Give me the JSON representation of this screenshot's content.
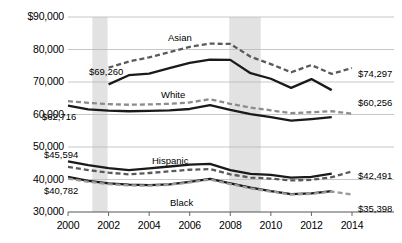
{
  "chart_data": {
    "type": "line",
    "title": "",
    "xlabel": "",
    "ylabel": "",
    "xlim": [
      2000,
      2014
    ],
    "ylim": [
      30000,
      90000
    ],
    "grid": true,
    "legend": "inline-labels",
    "y_ticks": [
      "$90,000",
      "80,000",
      "70,000",
      "60,000",
      "50,000",
      "40,000",
      "30,000"
    ],
    "y_tick_values": [
      90000,
      80000,
      70000,
      60000,
      50000,
      40000,
      30000
    ],
    "x_ticks": [
      "2000",
      "2002",
      "2004",
      "2006",
      "2008",
      "2010",
      "2012",
      "2014"
    ],
    "x_tick_values": [
      2000,
      2002,
      2004,
      2006,
      2008,
      2010,
      2012,
      2014
    ],
    "shaded_bands": [
      {
        "name": "recession-2001",
        "start": 2001.2,
        "end": 2001.95
      },
      {
        "name": "recession-2008",
        "start": 2007.95,
        "end": 2009.5
      }
    ],
    "series": [
      {
        "name": "Asian",
        "label": "Asian",
        "style": "solid",
        "color": "#1a1a1a",
        "x": [
          2002,
          2003,
          2004,
          2005,
          2006,
          2007,
          2008,
          2009,
          2010,
          2011,
          2012,
          2013
        ],
        "values": [
          69260,
          72100,
          72600,
          74300,
          75900,
          76900,
          76800,
          72700,
          71000,
          68200,
          70900,
          67500
        ]
      },
      {
        "name": "Asian-revised",
        "label": "",
        "style": "dashed",
        "color": "#5a5a5a",
        "x": [
          2002,
          2003,
          2004,
          2005,
          2006,
          2007,
          2008,
          2009,
          2010,
          2011,
          2012,
          2013,
          2014
        ],
        "values": [
          74400,
          76300,
          77600,
          79200,
          80800,
          81800,
          81700,
          77800,
          75500,
          73000,
          75200,
          72500,
          74297
        ]
      },
      {
        "name": "White",
        "label": "White",
        "style": "solid",
        "color": "#1a1a1a",
        "x": [
          2000,
          2001,
          2002,
          2003,
          2004,
          2005,
          2006,
          2007,
          2008,
          2009,
          2010,
          2011,
          2012,
          2013
        ],
        "values": [
          62716,
          61600,
          61200,
          61000,
          61100,
          61300,
          61700,
          62900,
          61400,
          60100,
          59200,
          58100,
          58600,
          59200
        ]
      },
      {
        "name": "White-revised",
        "label": "",
        "style": "dashed",
        "color": "#8c8c8c",
        "x": [
          2000,
          2001,
          2002,
          2003,
          2004,
          2005,
          2006,
          2007,
          2008,
          2009,
          2010,
          2011,
          2012,
          2013,
          2014
        ],
        "values": [
          64100,
          63600,
          63200,
          63000,
          63100,
          63300,
          63700,
          64700,
          63300,
          62100,
          61300,
          60400,
          60700,
          61000,
          60256
        ]
      },
      {
        "name": "Hispanic",
        "label": "Hispanic",
        "style": "solid",
        "color": "#1a1a1a",
        "x": [
          2000,
          2001,
          2002,
          2003,
          2004,
          2005,
          2006,
          2007,
          2008,
          2009,
          2010,
          2011,
          2012,
          2013
        ],
        "values": [
          45594,
          44400,
          43500,
          42900,
          43400,
          44000,
          44600,
          44800,
          42900,
          41700,
          41400,
          40600,
          40800,
          41800
        ]
      },
      {
        "name": "Hispanic-revised",
        "label": "",
        "style": "dashed",
        "color": "#5a5a5a",
        "x": [
          2000,
          2001,
          2002,
          2003,
          2004,
          2005,
          2006,
          2007,
          2008,
          2009,
          2010,
          2011,
          2012,
          2013,
          2014
        ],
        "values": [
          43900,
          42900,
          42100,
          41600,
          42000,
          42500,
          43000,
          43200,
          41600,
          40600,
          40300,
          39700,
          39900,
          40700,
          42491
        ]
      },
      {
        "name": "Black",
        "label": "Black",
        "style": "solid",
        "color": "#1a1a1a",
        "x": [
          2000,
          2001,
          2002,
          2003,
          2004,
          2005,
          2006,
          2007,
          2008,
          2009,
          2010,
          2011,
          2012,
          2013
        ],
        "values": [
          40782,
          39600,
          38800,
          38400,
          38300,
          38500,
          39300,
          40200,
          38800,
          37500,
          36400,
          35500,
          35700,
          36400
        ]
      },
      {
        "name": "Black-revised",
        "label": "",
        "style": "dashed",
        "color": "#9a9a9a",
        "x": [
          2000,
          2001,
          2002,
          2003,
          2004,
          2005,
          2006,
          2007,
          2008,
          2009,
          2010,
          2011,
          2012,
          2013,
          2014
        ],
        "values": [
          40300,
          39300,
          38600,
          38200,
          38100,
          38400,
          39100,
          40000,
          38600,
          37300,
          36300,
          35400,
          35600,
          36300,
          35398
        ]
      }
    ],
    "series_labels": [
      {
        "text": "Asian",
        "x": 168,
        "y": 32
      },
      {
        "text": "White",
        "x": 161,
        "y": 89
      },
      {
        "text": "Hispanic",
        "x": 152,
        "y": 155
      },
      {
        "text": "Black",
        "x": 170,
        "y": 197
      }
    ],
    "value_labels": [
      {
        "text": "$69,260",
        "x": 89,
        "y": 66,
        "align": "left"
      },
      {
        "text": "$62,716",
        "x": 42,
        "y": 111,
        "align": "left"
      },
      {
        "text": "$45,594",
        "x": 44,
        "y": 149,
        "align": "left"
      },
      {
        "text": "$40,782",
        "x": 44,
        "y": 185,
        "align": "left"
      },
      {
        "text": "$74,297",
        "x": 358,
        "y": 68,
        "align": "left"
      },
      {
        "text": "$60,256",
        "x": 358,
        "y": 97,
        "align": "left"
      },
      {
        "text": "$42,491",
        "x": 358,
        "y": 170,
        "align": "left"
      },
      {
        "text": "$35,398",
        "x": 358,
        "y": 203,
        "align": "left"
      }
    ],
    "colors": {
      "solid_line": "#1a1a1a",
      "dashed_line": "#5a5a5a",
      "gridline": "#b9b9b9",
      "axis": "#555555",
      "band": "#e2e2e2",
      "background": "#ffffff"
    }
  }
}
